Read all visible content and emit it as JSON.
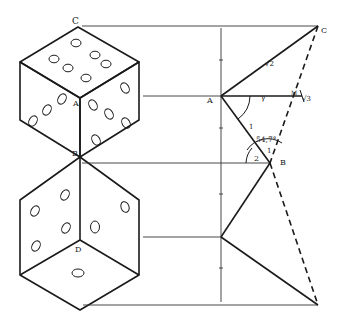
{
  "diagram": {
    "stroke_color": "#1a1a1a",
    "background": "#ffffff",
    "labels": {
      "top_vertex": "C",
      "center_top_die": "A",
      "shared_vertex": "B",
      "center_bottom_die": "D",
      "construction_C": "C",
      "construction_A": "A",
      "construction_B": "B",
      "construction_M": "M",
      "edge_AC": "√2",
      "edge_AM": "√3",
      "edge_AB": "1",
      "angle_value": "54,7°",
      "angle_1": "1",
      "angle_2": "2",
      "angle_mark": "γ"
    }
  }
}
